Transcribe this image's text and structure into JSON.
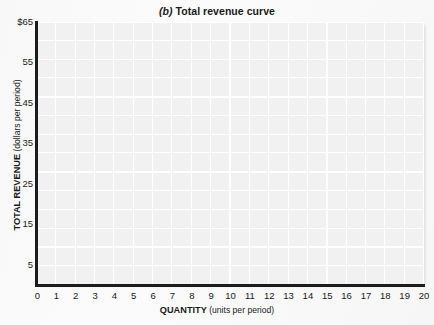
{
  "chart_data": {
    "type": "line",
    "title": "(b) Total revenue curve",
    "title_part_label": "(b)",
    "title_rest": " Total revenue curve",
    "xlabel_bold": "QUANTITY",
    "xlabel_units": "(units per period)",
    "ylabel_bold": "TOTAL REVENUE",
    "ylabel_units": "(dollars per period)",
    "xlim": [
      0,
      20
    ],
    "ylim": [
      0,
      65
    ],
    "x_tick_labels": [
      "0",
      "1",
      "2",
      "3",
      "4",
      "5",
      "6",
      "7",
      "8",
      "9",
      "10",
      "11",
      "12",
      "13",
      "14",
      "15",
      "16",
      "17",
      "18",
      "19",
      "20"
    ],
    "x_tick_values": [
      0,
      1,
      2,
      3,
      4,
      5,
      6,
      7,
      8,
      9,
      10,
      11,
      12,
      13,
      14,
      15,
      16,
      17,
      18,
      19,
      20
    ],
    "y_tick_labels": [
      "$65",
      "55",
      "45",
      "35",
      "25",
      "15",
      "5"
    ],
    "y_tick_values": [
      65,
      55,
      45,
      35,
      25,
      15,
      5
    ],
    "y_origin_label": "0",
    "grid": true,
    "grid_major_x_step": 5,
    "grid_minor_x_step": 1,
    "grid_major_y_step": 10,
    "grid_minor_y_step": 5,
    "legend": null,
    "series": [],
    "annotations": [],
    "plot_background_color": "#f1f1f1",
    "gridline_color": "#ffffff",
    "axis_color": "#1c1c1c",
    "page_background_color": "#fbfbfb",
    "note": "empty plotting grid; no data curve drawn"
  }
}
